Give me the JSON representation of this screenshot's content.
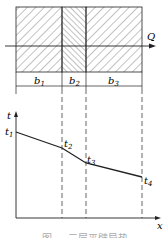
{
  "diagram": {
    "flow_label": "Q",
    "layers": [
      {
        "label": "b",
        "sub": "1"
      },
      {
        "label": "b",
        "sub": "2"
      },
      {
        "label": "b",
        "sub": "3"
      }
    ],
    "axis": {
      "y_label": "t",
      "x_label": "x"
    },
    "points": [
      {
        "label": "t",
        "sub": "1"
      },
      {
        "label": "t",
        "sub": "2"
      },
      {
        "label": "t",
        "sub": "3"
      },
      {
        "label": "t",
        "sub": "4"
      }
    ],
    "caption": "图 — 三层平壁导热"
  }
}
